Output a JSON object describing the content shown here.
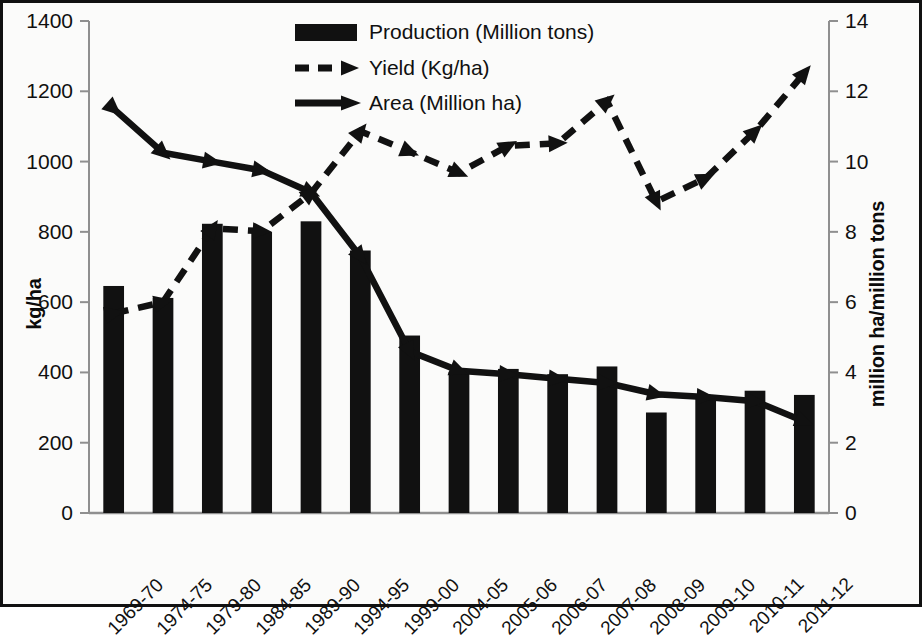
{
  "chart_data": {
    "type": "bar",
    "title": "",
    "xlabel": "",
    "ylabel": "kg/ha",
    "ylabel_right": "million ha/million tons",
    "ylim": [
      0,
      1400
    ],
    "ylim_right": [
      0,
      14
    ],
    "yticks": [
      "0",
      "200",
      "400",
      "600",
      "800",
      "1000",
      "1200",
      "1400"
    ],
    "yticks_right": [
      "0",
      "2",
      "4",
      "6",
      "8",
      "10",
      "12",
      "14"
    ],
    "grid": false,
    "legend_position": "top-center",
    "categories": [
      "1969-70",
      "1974-75",
      "1979-80",
      "1984-85",
      "1989-90",
      "1994-95",
      "1999-00",
      "2004-05",
      "2005-06",
      "2006-07",
      "2007-08",
      "2008-09",
      "2009-10",
      "2010-11",
      "2011-12"
    ],
    "series": [
      {
        "name": "Production (Million tons)",
        "axis": "right",
        "render": "bar",
        "values": [
          6.46,
          6.12,
          8.23,
          8.0,
          8.3,
          7.47,
          5.05,
          4.02,
          4.1,
          3.95,
          4.17,
          2.86,
          3.33,
          3.48,
          3.36
        ]
      },
      {
        "name": "Yield (Kg/ha)",
        "axis": "left",
        "render": "dashed-line",
        "values": [
          568,
          600,
          810,
          802,
          910,
          1086,
          1028,
          968,
          1045,
          1052,
          1172,
          886,
          953,
          1086,
          1252
        ]
      },
      {
        "name": "Area (Million ha)",
        "axis": "right",
        "render": "solid-line",
        "values": [
          11.5,
          10.25,
          10.0,
          9.75,
          9.12,
          7.3,
          4.6,
          4.05,
          3.95,
          3.82,
          3.7,
          3.38,
          3.3,
          3.18,
          2.6
        ]
      }
    ],
    "legend": [
      {
        "label": "Production (Million tons)",
        "marker": "bar-swatch"
      },
      {
        "label": "Yield (Kg/ha)",
        "marker": "dashed-arrow"
      },
      {
        "label": "Area (Million ha)",
        "marker": "solid-arrow"
      }
    ],
    "colors": {
      "series": "#111111",
      "axis": "#8a8a8a",
      "background": "#fbfbfa",
      "border": "#111111"
    }
  }
}
